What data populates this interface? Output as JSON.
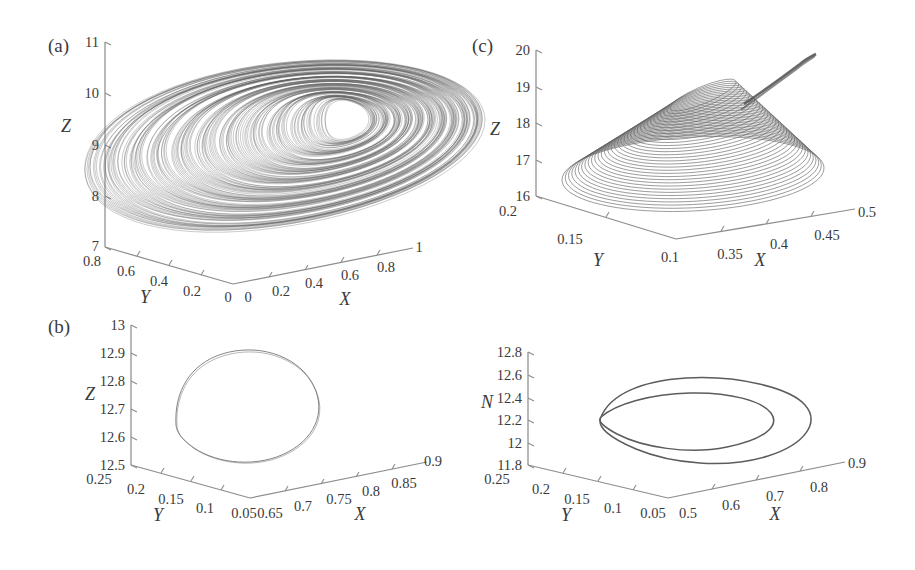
{
  "figure": {
    "background": "#ffffff",
    "line_color": "#5c5c5c",
    "axis_color": "#8d8d8d",
    "width": 915,
    "height": 570
  },
  "panels": [
    {
      "tag": "(a)",
      "type": "3d-phase-portrait",
      "content": "chaotic attractor",
      "zaxis": {
        "label": "Z",
        "ticks": [
          "7",
          "8",
          "9",
          "10",
          "11"
        ],
        "min": 7,
        "max": 11
      },
      "yaxis": {
        "label": "Y",
        "ticks": [
          "0.8",
          "0.6",
          "0.4",
          "0.2",
          "0"
        ],
        "min": 0,
        "max": 0.8
      },
      "xaxis": {
        "label": "X",
        "ticks": [
          "0",
          "0.2",
          "0.4",
          "0.6",
          "0.8",
          "1"
        ],
        "min": 0,
        "max": 1
      }
    },
    {
      "tag": "(b)",
      "type": "3d-phase-portrait",
      "content": "period-1 limit cycle",
      "zaxis": {
        "label": "Z",
        "ticks": [
          "12.5",
          "12.6",
          "12.7",
          "12.8",
          "12.9",
          "13"
        ],
        "min": 12.5,
        "max": 13
      },
      "yaxis": {
        "label": "Y",
        "ticks": [
          "0.25",
          "0.2",
          "0.15",
          "0.1",
          "0.05"
        ],
        "min": 0.05,
        "max": 0.25
      },
      "xaxis": {
        "label": "X",
        "ticks": [
          "0.65",
          "0.7",
          "0.75",
          "0.8",
          "0.85",
          "0.9"
        ],
        "min": 0.65,
        "max": 0.9
      }
    },
    {
      "tag": "(c)",
      "type": "3d-phase-portrait",
      "content": "spiralling funnel trajectory",
      "zaxis": {
        "label": "Z",
        "ticks": [
          "16",
          "17",
          "18",
          "19",
          "20"
        ],
        "min": 16,
        "max": 20
      },
      "yaxis": {
        "label": "Y",
        "ticks": [
          "0.2",
          "0.15",
          "0.1"
        ],
        "min": 0.1,
        "max": 0.2
      },
      "xaxis": {
        "label": "X",
        "ticks": [
          "0.35",
          "0.4",
          "0.45",
          "0.5"
        ],
        "min": 0.3,
        "max": 0.5
      }
    },
    {
      "tag": "",
      "type": "3d-phase-portrait",
      "content": "period-2 limit cycle",
      "zaxis": {
        "label": "N",
        "ticks": [
          "11.8",
          "12",
          "12.2",
          "12.4",
          "12.6",
          "12.8"
        ],
        "min": 11.8,
        "max": 12.8
      },
      "yaxis": {
        "label": "Y",
        "ticks": [
          "0.25",
          "0.2",
          "0.15",
          "0.1",
          "0.05"
        ],
        "min": 0.05,
        "max": 0.25
      },
      "xaxis": {
        "label": "X",
        "ticks": [
          "0.5",
          "0.6",
          "0.7",
          "0.8",
          "0.9"
        ],
        "min": 0.5,
        "max": 0.9
      }
    }
  ],
  "chart_data": {
    "type": "line",
    "title": "",
    "subplots": [
      {
        "tag": "(a)",
        "xlabel": "X",
        "ylabel": "Y",
        "zlabel": "Z",
        "xlim": [
          0,
          1
        ],
        "ylim": [
          0,
          0.8
        ],
        "zlim": [
          7,
          11
        ],
        "description": "dense chaotic attractor, wedge shaped band with interior void"
      },
      {
        "tag": "(b)",
        "xlabel": "X",
        "ylabel": "Y",
        "zlabel": "Z",
        "xlim": [
          0.65,
          0.9
        ],
        "ylim": [
          0.05,
          0.25
        ],
        "zlim": [
          12.5,
          13
        ],
        "description": "single closed periodic orbit"
      },
      {
        "tag": "(c)",
        "xlabel": "X",
        "ylabel": "Y",
        "zlabel": "Z",
        "xlim": [
          0.3,
          0.5
        ],
        "ylim": [
          0.1,
          0.2
        ],
        "zlim": [
          16,
          20
        ],
        "description": "spiral funnel, nested loops converging to narrow tail"
      },
      {
        "tag": "",
        "xlabel": "X",
        "ylabel": "Y",
        "zlabel": "N",
        "xlim": [
          0.5,
          0.9
        ],
        "ylim": [
          0.05,
          0.25
        ],
        "zlim": [
          11.8,
          12.8
        ],
        "description": "period-two orbit, two nested loops"
      }
    ]
  }
}
